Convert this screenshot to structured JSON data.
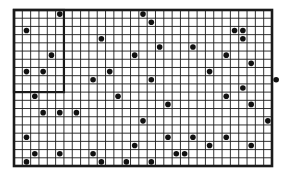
{
  "figure": {
    "type": "dot-grid",
    "frame": {
      "x": 14,
      "y": 10,
      "width": 258,
      "height": 156
    },
    "grid": {
      "cols": 31,
      "rows": 19
    },
    "inner_box": {
      "col_start": 0,
      "row_start": 0,
      "cols": 6,
      "rows": 10
    },
    "colors": {
      "line": "#1a1a1a",
      "dot": "#111111",
      "background": "#ffffff"
    },
    "dots": [
      [
        5,
        0
      ],
      [
        15,
        0
      ],
      [
        16,
        1
      ],
      [
        1,
        2
      ],
      [
        26,
        2
      ],
      [
        27,
        2
      ],
      [
        27,
        3
      ],
      [
        10,
        3
      ],
      [
        17,
        4
      ],
      [
        21,
        4
      ],
      [
        4,
        5
      ],
      [
        14,
        5
      ],
      [
        25,
        5
      ],
      [
        28,
        6
      ],
      [
        23,
        7
      ],
      [
        1,
        7
      ],
      [
        3,
        7
      ],
      [
        11,
        7
      ],
      [
        31,
        8
      ],
      [
        9,
        8
      ],
      [
        16,
        8
      ],
      [
        27,
        9
      ],
      [
        2,
        10
      ],
      [
        12,
        10
      ],
      [
        25,
        10
      ],
      [
        18,
        11
      ],
      [
        28,
        11
      ],
      [
        3,
        12
      ],
      [
        5,
        12
      ],
      [
        7,
        12
      ],
      [
        15,
        13
      ],
      [
        30,
        13
      ],
      [
        1,
        15
      ],
      [
        18,
        15
      ],
      [
        21,
        15
      ],
      [
        25,
        15
      ],
      [
        14,
        16
      ],
      [
        23,
        16
      ],
      [
        28,
        16
      ],
      [
        2,
        17
      ],
      [
        5,
        17
      ],
      [
        9,
        17
      ],
      [
        19,
        17
      ],
      [
        20,
        17
      ],
      [
        1,
        18
      ],
      [
        10,
        18
      ],
      [
        13,
        18
      ],
      [
        16,
        18
      ]
    ]
  }
}
